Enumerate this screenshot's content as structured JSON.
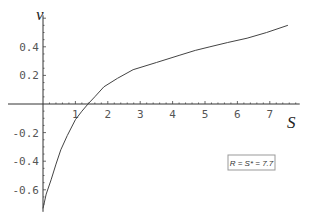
{
  "chart_data": {
    "type": "line",
    "title": "",
    "xlabel": "S",
    "ylabel": "v",
    "xlim": [
      0,
      7.8
    ],
    "ylim": [
      -0.74,
      0.55
    ],
    "xticks": [
      1,
      2,
      3,
      4,
      5,
      6,
      7
    ],
    "yticks": [
      -0.6,
      -0.4,
      -0.2,
      0.2,
      0.4
    ],
    "ytick_labels": [
      "-0.6",
      "-0.4",
      "-0.2",
      "0.2",
      "0.4"
    ],
    "xtick_labels": [
      "1",
      "2",
      "3",
      "4",
      "5",
      "6",
      "7"
    ],
    "grid": false,
    "annotation": "R = S* = 7.7",
    "annotation_placement": "bottom-right",
    "series": [
      {
        "name": "v(S)",
        "x": [
          0,
          0.1,
          0.25,
          0.4,
          0.55,
          0.75,
          1.0,
          1.2,
          1.39,
          1.6,
          1.88,
          2.3,
          2.78,
          3.5,
          4.2,
          4.7,
          5.15,
          5.7,
          6.3,
          6.9,
          7.56
        ],
        "y": [
          -0.73,
          -0.63,
          -0.53,
          -0.42,
          -0.32,
          -0.22,
          -0.11,
          -0.05,
          0.0,
          0.05,
          0.12,
          0.18,
          0.24,
          0.29,
          0.34,
          0.375,
          0.4,
          0.43,
          0.46,
          0.5,
          0.55
        ]
      }
    ]
  }
}
